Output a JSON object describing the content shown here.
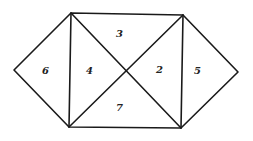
{
  "diagram": {
    "type": "hexagon-triangulation",
    "vertices": {
      "top_left": [
        71,
        13
      ],
      "top_right": [
        183,
        15
      ],
      "bottom_left": [
        69,
        127
      ],
      "bottom_right": [
        181,
        128
      ],
      "left_point": [
        14,
        70
      ],
      "right_point": [
        238,
        72
      ],
      "center": [
        126,
        71
      ]
    },
    "regions": [
      {
        "id": "region-6",
        "label": "6",
        "x": 45,
        "y": 74
      },
      {
        "id": "region-4",
        "label": "4",
        "x": 89,
        "y": 74
      },
      {
        "id": "region-3",
        "label": "3",
        "x": 119,
        "y": 37
      },
      {
        "id": "region-2",
        "label": "2",
        "x": 159,
        "y": 73
      },
      {
        "id": "region-5",
        "label": "5",
        "x": 197,
        "y": 74
      },
      {
        "id": "region-7",
        "label": "7",
        "x": 119,
        "y": 111
      }
    ],
    "stroke_color": "#1a1a1a"
  }
}
